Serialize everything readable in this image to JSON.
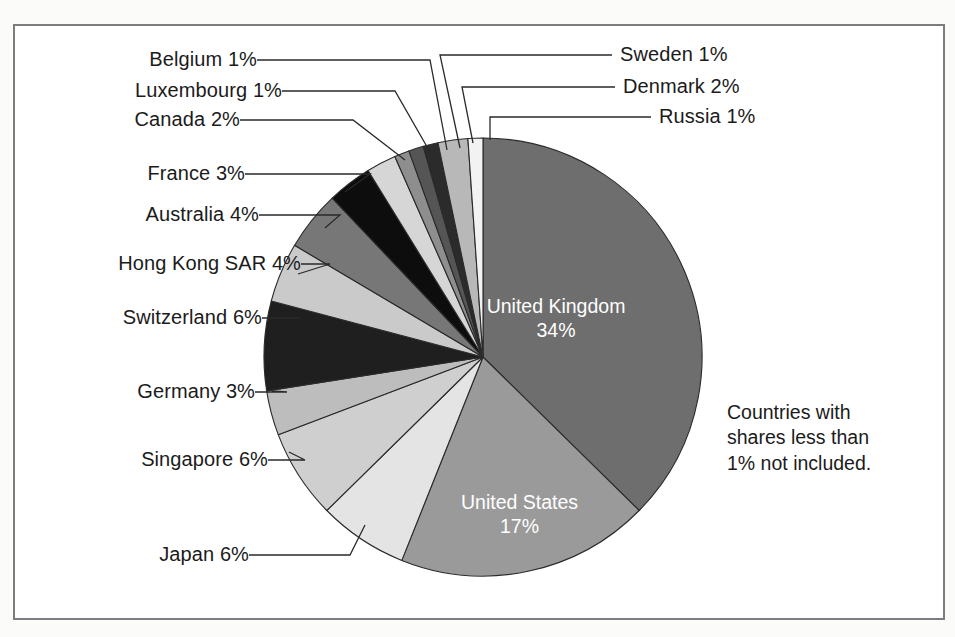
{
  "figure": {
    "background_color": "#ffffff",
    "frame_color": "#7d7d80",
    "note": "Countries with\nshares less than\n1% not included."
  },
  "chart_data": {
    "type": "pie",
    "title": "",
    "xlabel": "",
    "ylabel": "",
    "legend_position": "none",
    "grid": false,
    "units": "percent",
    "start_angle_deg": 0,
    "direction": "clockwise",
    "note": "Countries with shares less than 1% not included.",
    "categories": [
      "United Kingdom",
      "United States",
      "Japan",
      "Singapore",
      "Germany",
      "Switzerland",
      "Hong Kong SAR",
      "Australia",
      "France",
      "Canada",
      "Luxembourg",
      "Belgium",
      "Sweden",
      "Denmark",
      "Russia"
    ],
    "values": [
      34,
      17,
      6,
      6,
      3,
      6,
      4,
      4,
      3,
      2,
      1,
      1,
      1,
      2,
      1
    ],
    "slices": [
      {
        "label": "United Kingdom",
        "value": 34,
        "text": "United Kingdom 34%",
        "percent_text": "34%",
        "color": "#6e6e6e",
        "label_placement": "inside",
        "label_color": "#ffffff"
      },
      {
        "label": "United States",
        "value": 17,
        "text": "United States 17%",
        "percent_text": "17%",
        "color": "#9a9a9a",
        "label_placement": "inside",
        "label_color": "#ffffff"
      },
      {
        "label": "Japan",
        "value": 6,
        "text": "Japan 6%",
        "percent_text": "6%",
        "color": "#e4e4e4",
        "label_placement": "outside",
        "label_color": "#1b1b1b"
      },
      {
        "label": "Singapore",
        "value": 6,
        "text": "Singapore 6%",
        "percent_text": "6%",
        "color": "#cfcfcf",
        "label_placement": "outside",
        "label_color": "#1b1b1b"
      },
      {
        "label": "Germany",
        "value": 3,
        "text": "Germany 3%",
        "percent_text": "3%",
        "color": "#bdbdbd",
        "label_placement": "outside",
        "label_color": "#1b1b1b"
      },
      {
        "label": "Switzerland",
        "value": 6,
        "text": "Switzerland 6%",
        "percent_text": "6%",
        "color": "#1f1f1f",
        "label_placement": "outside",
        "label_color": "#1b1b1b"
      },
      {
        "label": "Hong Kong SAR",
        "value": 4,
        "text": "Hong Kong SAR 4%",
        "percent_text": "4%",
        "color": "#cacaca",
        "label_placement": "outside",
        "label_color": "#1b1b1b"
      },
      {
        "label": "Australia",
        "value": 4,
        "text": "Australia 4%",
        "percent_text": "4%",
        "color": "#777777",
        "label_placement": "outside",
        "label_color": "#1b1b1b"
      },
      {
        "label": "France",
        "value": 3,
        "text": "France 3%",
        "percent_text": "3%",
        "color": "#0d0d0d",
        "label_placement": "outside",
        "label_color": "#1b1b1b"
      },
      {
        "label": "Canada",
        "value": 2,
        "text": "Canada 2%",
        "percent_text": "2%",
        "color": "#d6d6d6",
        "label_placement": "outside",
        "label_color": "#1b1b1b"
      },
      {
        "label": "Luxembourg",
        "value": 1,
        "text": "Luxembourg 1%",
        "percent_text": "1%",
        "color": "#8e8e8e",
        "label_placement": "outside",
        "label_color": "#1b1b1b"
      },
      {
        "label": "Belgium",
        "value": 1,
        "text": "Belgium 1%",
        "percent_text": "1%",
        "color": "#555555",
        "label_placement": "outside",
        "label_color": "#1b1b1b"
      },
      {
        "label": "Sweden",
        "value": 1,
        "text": "Sweden 1%",
        "percent_text": "1%",
        "color": "#2b2b2b",
        "label_placement": "outside",
        "label_color": "#1b1b1b"
      },
      {
        "label": "Denmark",
        "value": 2,
        "text": "Denmark 2%",
        "percent_text": "2%",
        "color": "#b8b8b8",
        "label_placement": "outside",
        "label_color": "#1b1b1b"
      },
      {
        "label": "Russia",
        "value": 1,
        "text": "Russia 1%",
        "percent_text": "1%",
        "color": "#f2f2f2",
        "label_placement": "outside",
        "label_color": "#1b1b1b"
      }
    ]
  },
  "labels": {
    "belgium": "Belgium 1%",
    "luxembourg": "Luxembourg 1%",
    "canada": "Canada 2%",
    "france": "France 3%",
    "australia": "Australia 4%",
    "hong_kong": "Hong Kong SAR 4%",
    "switzerland": "Switzerland 6%",
    "germany": "Germany 3%",
    "singapore": "Singapore 6%",
    "japan": "Japan 6%",
    "sweden": "Sweden 1%",
    "denmark": "Denmark 2%",
    "russia": "Russia 1%",
    "united_kingdom_line1": "United Kingdom",
    "united_kingdom_line2": "34%",
    "united_states_line1": "United States",
    "united_states_line2": "17%",
    "note_line1": "Countries with",
    "note_line2": "shares less than",
    "note_line3": "1% not included."
  }
}
